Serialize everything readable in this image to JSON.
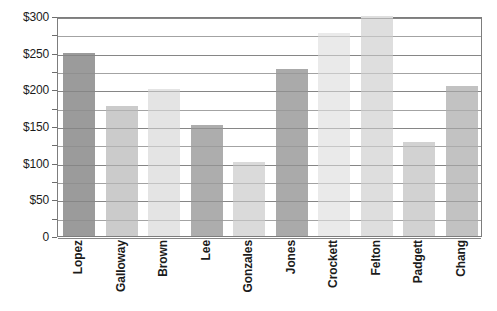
{
  "chart_data": {
    "type": "bar",
    "title": "",
    "xlabel": "",
    "ylabel": "",
    "categories": [
      "Lopez",
      "Galloway",
      "Brown",
      "Lee",
      "Gonzales",
      "Jones",
      "Crockett",
      "Felton",
      "Padgett",
      "Chang"
    ],
    "values": [
      250,
      177,
      201,
      152,
      101,
      228,
      277,
      300,
      128,
      205
    ],
    "series": [
      {
        "name": "Amount",
        "values": [
          250,
          177,
          201,
          152,
          101,
          228,
          277,
          300,
          128,
          205
        ]
      }
    ],
    "ylim": [
      0,
      300
    ],
    "y_major_ticks": [
      0,
      50,
      100,
      150,
      200,
      250,
      300
    ],
    "y_minor_ticks": [
      25,
      75,
      125,
      175,
      225,
      275
    ],
    "y_tick_labels": [
      "0",
      "$50",
      "$100",
      "$150",
      "$200",
      "$250",
      "$300"
    ],
    "grid": true,
    "grid_axis": "y",
    "legend": false,
    "legend_position": "none",
    "bar_colors": [
      "#9b9b9b",
      "#cbcbcb",
      "#e4e4e4",
      "#adadad",
      "#dadada",
      "#aaaaaa",
      "#eaeaea",
      "#dedede",
      "#d2d2d2",
      "#c2c2c2"
    ],
    "axis_color": "#7d7d7d",
    "gridline_color": "#b6b6b6",
    "background_color": "#ffffff",
    "text_color": "#1b1b1b"
  }
}
